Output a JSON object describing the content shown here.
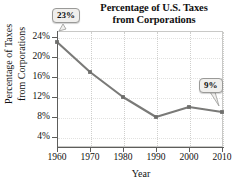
{
  "chart_data": {
    "type": "line",
    "title": "Percentage of U.S. Taxes from Corporations",
    "title_line1": "Percentage of U.S. Taxes",
    "title_line2": "from Corporations",
    "xlabel": "Year",
    "ylabel": "Percentage of Taxes from Corporations",
    "ylabel_line1": "Percentage of Taxes",
    "ylabel_line2": "from Corporations",
    "x": [
      1960,
      1970,
      1980,
      1990,
      2000,
      2010
    ],
    "categories": [
      "1960",
      "1970",
      "1980",
      "1990",
      "2000",
      "2010"
    ],
    "values": [
      23,
      17,
      12,
      8,
      10,
      9
    ],
    "xtick_labels": [
      "1960",
      "1970",
      "1980",
      "1990",
      "2000",
      "2010"
    ],
    "ytick_values": [
      4,
      8,
      12,
      16,
      20,
      24
    ],
    "ytick_labels": [
      "4%",
      "8%",
      "12%",
      "16%",
      "20%",
      "24%"
    ],
    "xlim": [
      1960,
      2010
    ],
    "ylim": [
      2,
      25
    ],
    "grid": true,
    "legend": false,
    "line_color": "#7a7a78",
    "marker_color": "#6e6e6c",
    "annotations": [
      {
        "name": "start-value",
        "label": "23%",
        "x": 1960,
        "y": 23
      },
      {
        "name": "end-value",
        "label": "9%",
        "x": 2010,
        "y": 9
      }
    ]
  }
}
